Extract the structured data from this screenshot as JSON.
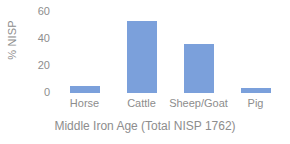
{
  "chart_data": {
    "type": "bar",
    "title": "",
    "subtitle": "",
    "categories": [
      "Horse",
      "Cattle",
      "Sheep/Goat",
      "Pig"
    ],
    "values": [
      5,
      53,
      36,
      4
    ],
    "series": [
      {
        "name": "% NISP",
        "values": [
          5,
          53,
          36,
          4
        ],
        "color": "#7ba0db"
      }
    ],
    "xlabel": "Middle Iron Age (Total NISP 1762)",
    "ylabel": "% NISP",
    "ylim": [
      0,
      60
    ],
    "yticks": [
      0,
      20,
      40,
      60
    ],
    "ytick_labels": [
      "0",
      "20",
      "40",
      "60"
    ],
    "grid": false,
    "legend": false,
    "legend_position": "none",
    "colors": {
      "bar": "#7ba0db",
      "text": "#8d8d8d",
      "background": "#ffffff"
    }
  },
  "axes": {
    "y_title": "% NISP",
    "x_title": "Middle Iron Age (Total NISP 1762)",
    "y_ticks": [
      {
        "label": "60",
        "value": 60
      },
      {
        "label": "40",
        "value": 40
      },
      {
        "label": "20",
        "value": 20
      },
      {
        "label": "0",
        "value": 0
      }
    ]
  },
  "bars": [
    {
      "label": "Horse",
      "value": 5
    },
    {
      "label": "Cattle",
      "value": 53
    },
    {
      "label": "Sheep/Goat",
      "value": 36
    },
    {
      "label": "Pig",
      "value": 4
    }
  ]
}
